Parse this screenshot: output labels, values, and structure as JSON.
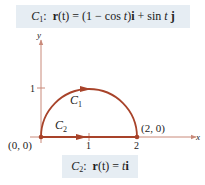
{
  "equations": {
    "c1": {
      "curve_name": "C",
      "curve_sub": "1",
      "sep": ":",
      "r": "r",
      "arg": "(t)",
      "eq": " = (1 − cos ",
      "t1": "t",
      "mid": ")",
      "i": "i",
      "plus": " + sin ",
      "t2": "t",
      "j": "j"
    },
    "c2": {
      "curve_name": "C",
      "curve_sub": "2",
      "sep": ":",
      "r": "r",
      "arg": "(t)",
      "eq": " = ",
      "t": "t",
      "i": "i"
    }
  },
  "graph": {
    "x_axis_label": "x",
    "y_axis_label": "y",
    "x_ticks": [
      "1",
      "2"
    ],
    "y_ticks": [
      "1"
    ],
    "origin_label": "(0, 0)",
    "endpoint_label": "(2, 0)",
    "curve1_label": "C",
    "curve1_sub": "1",
    "curve2_label": "C",
    "curve2_sub": "2",
    "curve_color": "#a8432a",
    "axis_color": "#c98a7a"
  }
}
